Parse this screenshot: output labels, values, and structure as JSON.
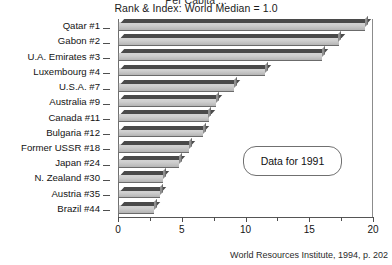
{
  "figure": {
    "clipped_title": "Per Capita ...",
    "subtitle": "Rank & Index: World Median = 1.0",
    "annotation": "Data for 1991",
    "source": "World Resources Institute, 1994, p. 202"
  },
  "chart_data": {
    "type": "bar",
    "orientation": "horizontal",
    "title": "Rank & Index: World Median = 1.0",
    "xlabel": "",
    "ylabel": "",
    "xlim": [
      0,
      20
    ],
    "xticks": [
      0,
      5,
      10,
      15,
      20
    ],
    "xtick_labels": [
      "0",
      "5",
      "10",
      "15",
      "20"
    ],
    "minor_xticks": [
      2.5,
      7.5,
      12.5,
      17.5
    ],
    "grid": false,
    "legend": null,
    "annotations": [
      "Data for 1991"
    ],
    "categories": [
      "Qatar #1",
      "Gabon #2",
      "U.A. Emirates #3",
      "Luxembourg #4",
      "U.S.A. #7",
      "Australia #9",
      "Canada #11",
      "Bulgaria #12",
      "Former USSR #18",
      "Japan #24",
      "N. Zealand #30",
      "Austria #35",
      "Brazil #44"
    ],
    "values": [
      19.4,
      17.3,
      16.0,
      11.5,
      9.1,
      7.7,
      7.1,
      6.7,
      5.6,
      4.8,
      3.5,
      3.3,
      2.8
    ],
    "series": [
      {
        "name": "Index (World Median = 1.0)",
        "values": [
          19.4,
          17.3,
          16.0,
          11.5,
          9.1,
          7.7,
          7.1,
          6.7,
          5.6,
          4.8,
          3.5,
          3.3,
          2.8
        ]
      }
    ]
  },
  "colors": {
    "bar_front": "#cfcfcf",
    "bar_top": "#4a4a4a",
    "bar_side": "#8f8f8f",
    "axis": "#4f4f4f",
    "text": "#131313",
    "background": "#ffffff"
  }
}
